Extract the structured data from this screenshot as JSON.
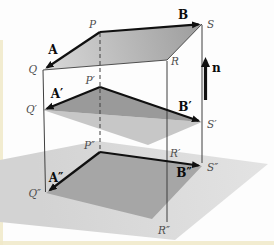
{
  "figure": {
    "point_labels": {
      "P": "P",
      "Q": "Q",
      "R": "R",
      "S": "S",
      "P1": "P′",
      "Q1": "Q′",
      "R1": "R′",
      "S1": "S′",
      "P2": "P″",
      "Q2": "Q″",
      "R2": "R″",
      "S2": "S″"
    },
    "vector_labels": {
      "A": "A",
      "B": "B",
      "A1": "A′",
      "B1": "B′",
      "A2": "A″",
      "B2": "B″",
      "n": "n"
    },
    "colors": {
      "background": "#fdfdfd",
      "page_edge": "#f0e9c8",
      "top_plane_light": "#d9d9d9",
      "top_plane_dark": "#9d9d9d",
      "middle_plane_dark": "#9a9a9a",
      "middle_plane_light": "#c7c7c7",
      "ground_plane": "#d3d3d3",
      "ground_plane_light": "#e3e3e3",
      "ground_quad": "#a6a6a6",
      "line": "#3f3f3f",
      "vector": "#101010",
      "point_label": "#4d4d4d"
    }
  }
}
